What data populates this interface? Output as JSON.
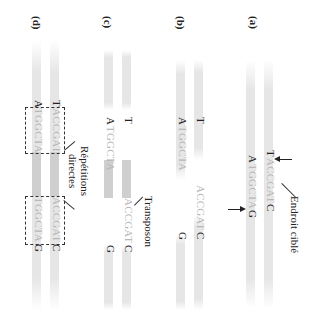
{
  "panels": {
    "a": {
      "label": "(a)",
      "top_left": "T",
      "top_seq": "ACCGAT",
      "top_right": "C",
      "bottom_left": "A",
      "bottom_seq": "TGGCTA",
      "bottom_right": "G",
      "annotation": "Endroit ciblé"
    },
    "b": {
      "label": "(b)",
      "top_left": "T",
      "top_seq": "ACCGAT",
      "top_right": "C",
      "bottom_left": "A",
      "bottom_seq": "TGGCTA",
      "bottom_right": "G"
    },
    "c": {
      "label": "(c)",
      "top_left": "T",
      "top_seq": "ACCGAT",
      "top_right": "C",
      "bottom_left": "A",
      "bottom_seq": "TGGCTA",
      "bottom_right": "G",
      "annotation": "Transposon"
    },
    "d": {
      "label": "(d)",
      "top_left": "T",
      "top_seq_left": "ACCGAT",
      "top_seq_right": "ACCGAT",
      "top_right": "C",
      "bottom_left": "A",
      "bottom_seq_left": "TGGCTA",
      "bottom_seq_right": "TGGCTA",
      "bottom_right": "G",
      "annotation_line1": "Répétitions",
      "annotation_line2": "directes"
    }
  }
}
